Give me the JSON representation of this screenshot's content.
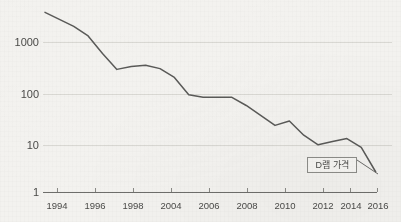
{
  "chart_data": {
    "type": "line",
    "title": "",
    "subtitle": "",
    "xlabel": "",
    "ylabel": "",
    "yscale": "log",
    "ylim": [
      1,
      6000
    ],
    "xlim": [
      1993,
      2017
    ],
    "grid": true,
    "legend_position": "none",
    "y_ticks": [
      "1000",
      "100",
      "10",
      "1"
    ],
    "y_tick_values": [
      1000,
      100,
      10,
      1
    ],
    "x_ticks": [
      "1994",
      "1996",
      "1998",
      "2004",
      "2006",
      "2008",
      "2010",
      "2012",
      "2014",
      "2016"
    ],
    "x_tick_values": [
      1994,
      1996,
      1998,
      2000,
      2002,
      2004,
      2006,
      2008,
      2010,
      2012
    ],
    "series": [
      {
        "name": "D램 가격",
        "color": "#5a5a58",
        "x": [
          1993,
          1995,
          1996,
          1997,
          1998,
          1999,
          2000,
          2001,
          2002,
          2003,
          2004,
          2005,
          2006,
          2007,
          2008,
          2009,
          2010,
          2011,
          2012,
          2013,
          2014,
          2015,
          2016
        ],
        "values": [
          4000,
          2100,
          1350,
          600,
          290,
          330,
          350,
          300,
          200,
          90,
          80,
          80,
          80,
          55,
          35,
          22,
          27,
          14,
          9,
          10.5,
          12,
          8,
          2.6
        ]
      }
    ],
    "annotations": [
      {
        "name": "dram-price-callout",
        "text": "D램 가격",
        "series": "D램 가격"
      }
    ]
  },
  "axis": {
    "y_label_1000": "1000",
    "y_label_100": "100",
    "y_label_10": "10",
    "y_label_1": "1"
  },
  "x_labels": {
    "l0": "1994",
    "l1": "1996",
    "l2": "1998",
    "l3": "2004",
    "l4": "2006",
    "l5": "2008",
    "l6": "2010",
    "l7": "2012",
    "l8": "2014",
    "l9": "2016"
  },
  "annotation": {
    "label": "D램 가격"
  },
  "colors": {
    "background": "#f3f2ef",
    "line": "#5a5a58",
    "gridline": "#d8d7d2",
    "axis": "#6b6b68",
    "text": "#4a4a48"
  }
}
